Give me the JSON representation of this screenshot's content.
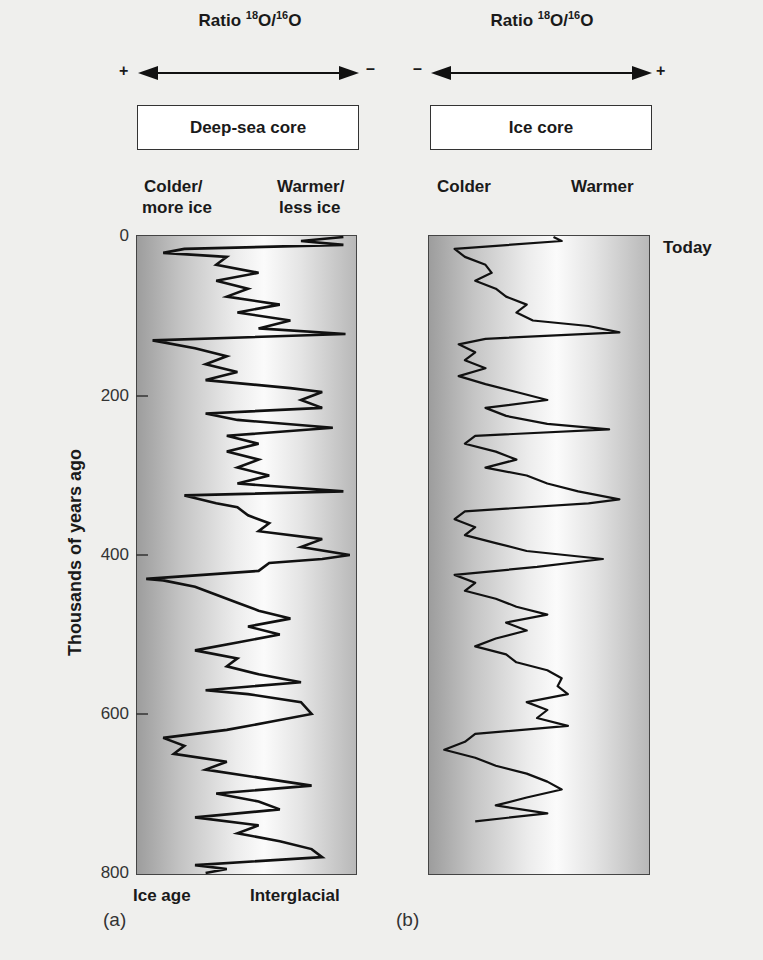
{
  "panel_a": {
    "ratio_title": {
      "prefix": "Ratio ",
      "sup1": "18",
      "mid": "O/",
      "sup2": "16",
      "suffix": "O"
    },
    "left_sign": "+",
    "right_sign": "–",
    "box_label": "Deep-sea core",
    "left_label_line1": "Colder/",
    "left_label_line2": "more ice",
    "right_label_line1": "Warmer/",
    "right_label_line2": "less ice",
    "bottom_left": "Ice age",
    "bottom_right": "Interglacial",
    "letter": "(a)"
  },
  "panel_b": {
    "ratio_title": {
      "prefix": "Ratio ",
      "sup1": "18",
      "mid": "O/",
      "sup2": "16",
      "suffix": "O"
    },
    "left_sign": "–",
    "right_sign": "+",
    "box_label": "Ice core",
    "left_label": "Colder",
    "right_label": "Warmer",
    "today_label": "Today",
    "letter": "(b)"
  },
  "y_axis": {
    "label": "Thousands of years ago",
    "ticks": [
      "0",
      "200",
      "400",
      "600",
      "800"
    ]
  },
  "chart_data": [
    {
      "type": "line",
      "title": "Deep-sea core",
      "xlabel": "Ratio 18O/16O (+ left, – right)",
      "ylabel": "Thousands of years ago",
      "ylim": [
        0,
        800
      ],
      "y_inverted": true,
      "x_scale": "0 = colder/more ice (ice age), 1 = warmer/less ice (interglacial)",
      "series": [
        {
          "name": "Deep-sea core δ18O",
          "y": [
            0,
            5,
            10,
            15,
            20,
            25,
            35,
            45,
            55,
            65,
            75,
            85,
            95,
            105,
            115,
            122,
            130,
            140,
            150,
            160,
            170,
            180,
            190,
            195,
            205,
            215,
            222,
            230,
            240,
            250,
            260,
            270,
            280,
            290,
            300,
            310,
            320,
            325,
            335,
            340,
            350,
            360,
            370,
            380,
            390,
            400,
            405,
            410,
            420,
            430,
            432,
            440,
            450,
            460,
            470,
            480,
            490,
            500,
            510,
            520,
            530,
            540,
            550,
            560,
            570,
            575,
            585,
            600,
            610,
            620,
            630,
            640,
            650,
            660,
            670,
            680,
            690,
            700,
            710,
            720,
            730,
            740,
            750,
            760,
            770,
            780,
            790,
            795,
            800
          ],
          "x": [
            0.95,
            0.75,
            0.95,
            0.2,
            0.1,
            0.4,
            0.35,
            0.55,
            0.35,
            0.5,
            0.4,
            0.65,
            0.45,
            0.7,
            0.55,
            0.96,
            0.05,
            0.25,
            0.4,
            0.3,
            0.45,
            0.3,
            0.7,
            0.85,
            0.75,
            0.85,
            0.3,
            0.45,
            0.9,
            0.4,
            0.55,
            0.4,
            0.55,
            0.45,
            0.6,
            0.45,
            0.95,
            0.2,
            0.35,
            0.45,
            0.5,
            0.6,
            0.55,
            0.85,
            0.75,
            0.98,
            0.85,
            0.6,
            0.55,
            0.02,
            0.1,
            0.25,
            0.35,
            0.45,
            0.55,
            0.7,
            0.5,
            0.65,
            0.45,
            0.25,
            0.45,
            0.4,
            0.55,
            0.75,
            0.3,
            0.5,
            0.75,
            0.8,
            0.6,
            0.4,
            0.1,
            0.2,
            0.15,
            0.4,
            0.3,
            0.55,
            0.8,
            0.35,
            0.55,
            0.65,
            0.25,
            0.55,
            0.45,
            0.65,
            0.8,
            0.85,
            0.25,
            0.4,
            0.3
          ]
        }
      ]
    },
    {
      "type": "line",
      "title": "Ice core",
      "xlabel": "Ratio 18O/16O (– left, + right)",
      "ylabel": "Thousands of years ago",
      "ylim": [
        0,
        800
      ],
      "y_inverted": true,
      "x_scale": "0 = colder, 1 = warmer",
      "series": [
        {
          "name": "Ice core δ18O",
          "y": [
            0,
            5,
            15,
            25,
            35,
            45,
            55,
            65,
            75,
            85,
            95,
            105,
            112,
            120,
            128,
            135,
            145,
            155,
            165,
            175,
            185,
            195,
            205,
            215,
            225,
            235,
            242,
            250,
            260,
            270,
            280,
            290,
            300,
            310,
            320,
            330,
            335,
            345,
            355,
            365,
            375,
            385,
            395,
            405,
            415,
            425,
            435,
            445,
            455,
            465,
            475,
            485,
            495,
            505,
            515,
            525,
            535,
            545,
            555,
            565,
            575,
            585,
            595,
            605,
            615,
            625,
            635,
            645,
            655,
            665,
            675,
            685,
            695,
            705,
            715,
            725,
            735
          ],
          "x": [
            0.58,
            0.62,
            0.1,
            0.15,
            0.25,
            0.28,
            0.2,
            0.3,
            0.35,
            0.45,
            0.4,
            0.48,
            0.75,
            0.9,
            0.25,
            0.12,
            0.2,
            0.15,
            0.25,
            0.12,
            0.25,
            0.4,
            0.55,
            0.25,
            0.35,
            0.55,
            0.85,
            0.2,
            0.15,
            0.3,
            0.4,
            0.25,
            0.45,
            0.55,
            0.7,
            0.9,
            0.75,
            0.15,
            0.1,
            0.2,
            0.15,
            0.3,
            0.45,
            0.82,
            0.5,
            0.1,
            0.2,
            0.15,
            0.3,
            0.4,
            0.55,
            0.35,
            0.45,
            0.3,
            0.2,
            0.35,
            0.4,
            0.55,
            0.62,
            0.6,
            0.65,
            0.45,
            0.55,
            0.5,
            0.65,
            0.2,
            0.15,
            0.05,
            0.2,
            0.3,
            0.45,
            0.55,
            0.62,
            0.45,
            0.3,
            0.55,
            0.2
          ]
        }
      ]
    }
  ]
}
